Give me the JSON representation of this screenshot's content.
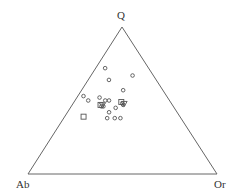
{
  "chart_data": {
    "type": "ternary_scatter",
    "title": "",
    "vertices": {
      "top": "Q",
      "bottom_left": "Ab",
      "bottom_right": "Or"
    },
    "grid": false,
    "legend": null,
    "series": [
      {
        "name": "circles",
        "marker": "circle",
        "points": [
          {
            "Q": 72,
            "Ab": 23,
            "Or": 5
          },
          {
            "Q": 67,
            "Ab": 11,
            "Or": 22
          },
          {
            "Q": 64,
            "Ab": 25,
            "Or": 11
          },
          {
            "Q": 57,
            "Ab": 21,
            "Or": 22
          },
          {
            "Q": 53,
            "Ab": 44,
            "Or": 3
          },
          {
            "Q": 50,
            "Ab": 43,
            "Or": 7
          },
          {
            "Q": 52,
            "Ab": 36,
            "Or": 12
          },
          {
            "Q": 50,
            "Ab": 34,
            "Or": 16
          },
          {
            "Q": 50,
            "Ab": 32,
            "Or": 18
          },
          {
            "Q": 46,
            "Ab": 38,
            "Or": 16
          },
          {
            "Q": 46,
            "Ab": 37,
            "Or": 17
          },
          {
            "Q": 45,
            "Ab": 31,
            "Or": 24
          },
          {
            "Q": 42,
            "Ab": 36,
            "Or": 22
          },
          {
            "Q": 38,
            "Ab": 39,
            "Or": 23
          },
          {
            "Q": 38,
            "Ab": 35,
            "Or": 27
          },
          {
            "Q": 38,
            "Ab": 32,
            "Or": 30
          },
          {
            "Q": 48,
            "Ab": 26,
            "Or": 26
          },
          {
            "Q": 47,
            "Ab": 26,
            "Or": 27
          }
        ]
      },
      {
        "name": "squares",
        "marker": "square",
        "points": [
          {
            "Q": 39,
            "Ab": 51,
            "Or": 10
          },
          {
            "Q": 49,
            "Ab": 26,
            "Or": 25
          },
          {
            "Q": 47,
            "Ab": 38,
            "Or": 15
          }
        ]
      },
      {
        "name": "triangles",
        "marker": "triangle-down",
        "points": [
          {
            "Q": 48,
            "Ab": 25,
            "Or": 27
          },
          {
            "Q": 47,
            "Ab": 37,
            "Or": 16
          }
        ]
      }
    ]
  },
  "labels": {
    "top": "Q",
    "left": "Ab",
    "right": "Or"
  },
  "colors": {
    "line": "#555555",
    "marker": "#555555"
  }
}
